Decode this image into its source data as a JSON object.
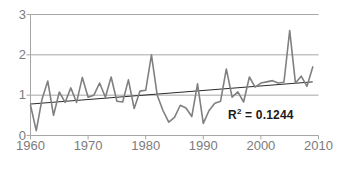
{
  "chart_data": {
    "type": "line",
    "title": "",
    "xlabel": "",
    "ylabel": "",
    "xlim": [
      1960,
      2010
    ],
    "ylim": [
      0,
      3
    ],
    "grid": true,
    "legend": "none",
    "x_ticks": [
      "1960",
      "1970",
      "1980",
      "1990",
      "2000",
      "2010"
    ],
    "x_tick_values": [
      1960,
      1970,
      1980,
      1990,
      2000,
      2010
    ],
    "y_ticks": [
      "0",
      "1",
      "2",
      "3"
    ],
    "y_tick_values": [
      0,
      1,
      2,
      3
    ],
    "annotations": [
      {
        "name": "r-squared",
        "prefix": "R",
        "superscript": "2",
        "suffix": " = 0.1244",
        "text": "R2 = 0.1244",
        "value": 0.1244
      }
    ],
    "series": [
      {
        "name": "annual-value",
        "color": "#808080",
        "x": [
          1960,
          1961,
          1962,
          1963,
          1964,
          1965,
          1966,
          1967,
          1968,
          1969,
          1970,
          1971,
          1972,
          1973,
          1974,
          1975,
          1976,
          1977,
          1978,
          1979,
          1980,
          1981,
          1982,
          1983,
          1984,
          1985,
          1986,
          1987,
          1988,
          1989,
          1990,
          1991,
          1992,
          1993,
          1994,
          1995,
          1996,
          1997,
          1998,
          1999,
          2000,
          2001,
          2002,
          2003,
          2004,
          2005,
          2006,
          2007,
          2008,
          2009
        ],
        "values": [
          0.75,
          0.12,
          0.9,
          1.35,
          0.5,
          1.08,
          0.82,
          1.18,
          0.82,
          1.44,
          0.95,
          1.0,
          1.3,
          0.95,
          1.45,
          0.85,
          0.83,
          1.38,
          0.67,
          1.1,
          1.12,
          2.0,
          1.0,
          0.62,
          0.33,
          0.45,
          0.75,
          0.68,
          0.47,
          1.28,
          0.3,
          0.62,
          0.8,
          0.85,
          1.65,
          0.95,
          1.08,
          0.83,
          1.45,
          1.2,
          1.3,
          1.33,
          1.36,
          1.3,
          1.32,
          2.6,
          1.3,
          1.47,
          1.22,
          1.7
        ]
      },
      {
        "name": "linear-trend",
        "color": "#2a2a2a",
        "x": [
          1960,
          2009
        ],
        "values": [
          0.78,
          1.33
        ]
      }
    ]
  },
  "colors": {
    "data_line": "#808080",
    "trend_line": "#2a2a2a",
    "gridline": "#a6a6a6",
    "axis": "#a6a6a6",
    "tick_label": "#7c7c7c",
    "annotation_text": "#1a1a1a",
    "background": "#ffffff"
  }
}
